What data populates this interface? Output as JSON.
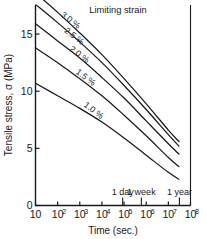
{
  "chart_data": {
    "type": "line",
    "title": "",
    "annotation_title": "Limiting strain",
    "xlabel": "Time (sec.)",
    "ylabel": "Tensile stress, σ  (MPa)",
    "xscale": "log",
    "xlim": [
      10,
      100000000
    ],
    "ylim": [
      0,
      17.5
    ],
    "yticks": [
      0,
      5,
      10,
      15
    ],
    "ytick_labels": [
      "0",
      "5",
      "10",
      "15"
    ],
    "xticks": [
      10,
      100,
      1000,
      10000,
      100000,
      1000000,
      10000000,
      100000000
    ],
    "xtick_labels": [
      "10",
      "10",
      "10",
      "10",
      "10",
      "10",
      "10",
      "10"
    ],
    "xtick_exponents": [
      "",
      "2",
      "3",
      "4",
      "5",
      "6",
      "7",
      "8"
    ],
    "grid": false,
    "legend": "inline-labels",
    "time_markers": [
      {
        "label": "1 day",
        "x": 86400
      },
      {
        "label": "1 week",
        "x": 604800
      },
      {
        "label": "1 year",
        "x": 31536000
      }
    ],
    "series": [
      {
        "name": "3.0 %",
        "label": "3.0 %",
        "x": [
          10,
          100,
          1000,
          10000,
          100000,
          1000000,
          10000000,
          30000000
        ],
        "values": [
          18.6,
          16.9,
          15.1,
          13.2,
          11.1,
          8.9,
          6.6,
          5.6
        ]
      },
      {
        "name": "2.5 %",
        "label": "2.5 %",
        "x": [
          10,
          100,
          1000,
          10000,
          100000,
          1000000,
          10000000,
          30000000
        ],
        "values": [
          17.6,
          16.0,
          14.3,
          12.5,
          10.5,
          8.4,
          6.2,
          5.2
        ]
      },
      {
        "name": "2.0 %",
        "label": "2.0 %",
        "x": [
          10,
          100,
          1000,
          10000,
          100000,
          1000000,
          10000000,
          30000000
        ],
        "values": [
          15.9,
          14.4,
          12.9,
          11.2,
          9.4,
          7.4,
          5.4,
          4.5
        ]
      },
      {
        "name": "1.5 %",
        "label": "1.5 %",
        "x": [
          10,
          100,
          1000,
          10000,
          100000,
          1000000,
          10000000,
          30000000
        ],
        "values": [
          13.8,
          12.5,
          11.1,
          9.6,
          7.9,
          6.1,
          4.2,
          3.4
        ]
      },
      {
        "name": "1.0 %",
        "label": "1.0 %",
        "x": [
          10,
          100,
          1000,
          10000,
          100000,
          1000000,
          10000000,
          30000000
        ],
        "values": [
          10.7,
          9.6,
          8.5,
          7.3,
          5.9,
          4.4,
          2.9,
          2.3
        ]
      }
    ]
  }
}
